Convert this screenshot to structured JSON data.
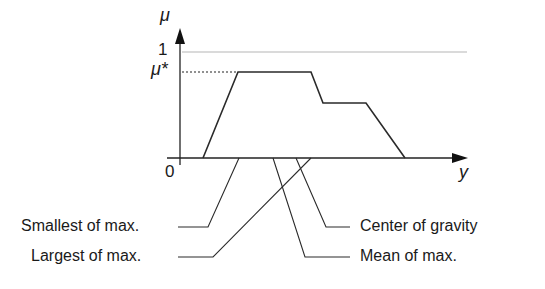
{
  "diagram": {
    "y_axis_label": "μ",
    "x_axis_label": "y",
    "tick_one": "1",
    "tick_mu_star": "μ*",
    "origin": "0",
    "labels": {
      "smallest_of_max": "Smallest of max.",
      "largest_of_max": "Largest of max.",
      "center_of_gravity": "Center of gravity",
      "mean_of_max": "Mean of max."
    },
    "colors": {
      "stroke": "#2a2a2a",
      "guide": "#b0b0b0"
    }
  }
}
